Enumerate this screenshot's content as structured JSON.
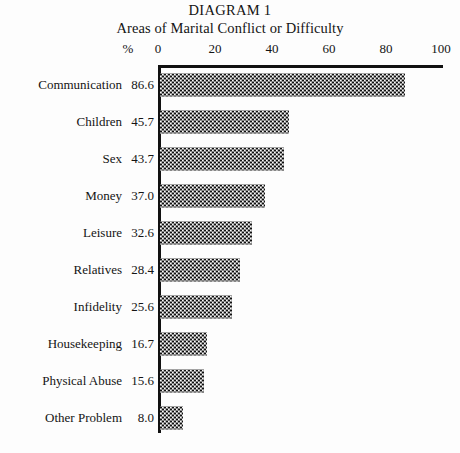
{
  "chart_data": {
    "type": "bar",
    "orientation": "horizontal",
    "title": "DIAGRAM 1",
    "subtitle": "Areas of Marital Conflict or Difficulty",
    "xlabel": "%",
    "ylabel": "",
    "xlim": [
      0,
      100
    ],
    "xticks": [
      0,
      20,
      40,
      60,
      80,
      100
    ],
    "xtick_labels": [
      "0",
      "20",
      "40",
      "60",
      "80",
      "100"
    ],
    "grid": false,
    "legend": null,
    "categories": [
      "Communication",
      "Children",
      "Sex",
      "Money",
      "Leisure",
      "Relatives",
      "Infidelity",
      "Housekeeping",
      "Physical Abuse",
      "Other Problem"
    ],
    "values": [
      86.6,
      45.7,
      43.7,
      37.0,
      32.6,
      28.4,
      25.6,
      16.7,
      15.6,
      8.0
    ],
    "value_labels": [
      "86.6",
      "45.7",
      "43.7",
      "37.0",
      "32.6",
      "28.4",
      "25.6",
      "16.7",
      "15.6",
      "8.0"
    ],
    "bar_fill": "checkerboard-hatch",
    "bar_color": "#111111",
    "background_color": "#fdfdfd"
  }
}
